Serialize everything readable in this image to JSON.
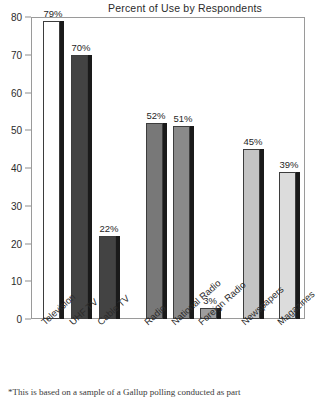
{
  "chart_data": {
    "type": "bar",
    "title": "Percent of Use by Respondents",
    "xlabel": "",
    "ylabel": "",
    "ylim": [
      0,
      80
    ],
    "yticks": [
      0,
      10,
      20,
      30,
      40,
      50,
      60,
      70,
      80
    ],
    "grid": false,
    "legend": null,
    "categories": [
      "Television",
      "UHF TV",
      "Cable TV",
      "Radio",
      "National Radio",
      "Foreign Radio",
      "Newspapers",
      "Magazines"
    ],
    "values": [
      79,
      70,
      22,
      52,
      51,
      3,
      45,
      39
    ],
    "value_labels": [
      "79%",
      "70%",
      "22%",
      "52%",
      "51%",
      "3%",
      "45%",
      "39%"
    ],
    "bar_fills": [
      "#ffffff",
      "#434343",
      "#434343",
      "#787878",
      "#8a8a8a",
      "#9e9e9e",
      "#c4c4c4",
      "#dcdcdc"
    ],
    "bar_edge_color": "#3d3d3d",
    "bar_shadow_color": "#1a1a1a",
    "axis_color": "#9a9a9a"
  },
  "footnote": "*This is based on a sample of a Gallup polling conducted as part"
}
